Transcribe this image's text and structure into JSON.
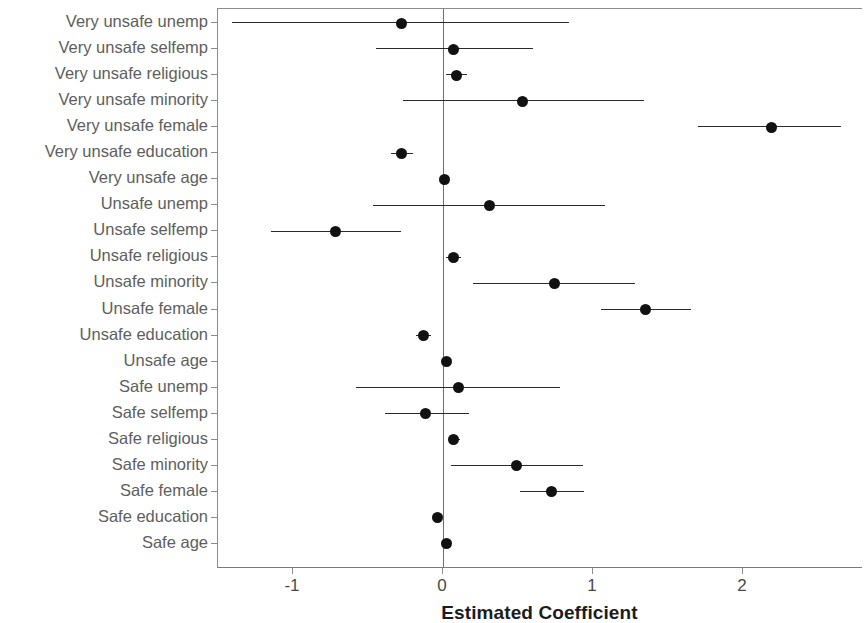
{
  "chart_data": {
    "type": "scatter",
    "subtype": "coefficient-plot-with-error-bars",
    "title": "",
    "xlabel": "Estimated Coefficient",
    "ylabel": "",
    "xlim": [
      -1.5,
      2.8
    ],
    "ylim": [
      0,
      22
    ],
    "grid": false,
    "legend": null,
    "xticks": [
      -1,
      0,
      1,
      2
    ],
    "xtick_labels": [
      "-1",
      "0",
      "1",
      "2"
    ],
    "zero_reference_line": 0,
    "marker": "filled-circle",
    "categories": [
      "Very unsafe unemp",
      "Very unsafe selfemp",
      "Very unsafe religious",
      "Very unsafe minority",
      "Very unsafe female",
      "Very unsafe education",
      "Very unsafe age",
      "Unsafe unemp",
      "Unsafe selfemp",
      "Unsafe religious",
      "Unsafe minority",
      "Unsafe female",
      "Unsafe education",
      "Unsafe age",
      "Safe unemp",
      "Safe selfemp",
      "Safe religious",
      "Safe minority",
      "Safe female",
      "Safe education",
      "Safe age"
    ],
    "points": [
      {
        "label": "Very unsafe unemp",
        "estimate": -0.28,
        "low": -1.41,
        "high": 0.84
      },
      {
        "label": "Very unsafe selfemp",
        "estimate": 0.07,
        "low": -0.45,
        "high": 0.6
      },
      {
        "label": "Very unsafe religious",
        "estimate": 0.09,
        "low": 0.02,
        "high": 0.16
      },
      {
        "label": "Very unsafe minority",
        "estimate": 0.53,
        "low": -0.27,
        "high": 1.34
      },
      {
        "label": "Very unsafe female",
        "estimate": 2.19,
        "low": 1.7,
        "high": 2.65
      },
      {
        "label": "Very unsafe education",
        "estimate": -0.28,
        "low": -0.35,
        "high": -0.2
      },
      {
        "label": "Very unsafe age",
        "estimate": 0.01,
        "low": -0.01,
        "high": 0.03
      },
      {
        "label": "Unsafe unemp",
        "estimate": 0.31,
        "low": -0.47,
        "high": 1.08
      },
      {
        "label": "Unsafe selfemp",
        "estimate": -0.72,
        "low": -1.15,
        "high": -0.28
      },
      {
        "label": "Unsafe religious",
        "estimate": 0.07,
        "low": 0.02,
        "high": 0.12
      },
      {
        "label": "Unsafe minority",
        "estimate": 0.74,
        "low": 0.2,
        "high": 1.28
      },
      {
        "label": "Unsafe female",
        "estimate": 1.35,
        "low": 1.05,
        "high": 1.65
      },
      {
        "label": "Unsafe education",
        "estimate": -0.13,
        "low": -0.18,
        "high": -0.08
      },
      {
        "label": "Unsafe age",
        "estimate": 0.02,
        "low": 0.0,
        "high": 0.03
      },
      {
        "label": "Safe unemp",
        "estimate": 0.1,
        "low": -0.58,
        "high": 0.78
      },
      {
        "label": "Safe selfemp",
        "estimate": -0.12,
        "low": -0.39,
        "high": 0.17
      },
      {
        "label": "Safe religious",
        "estimate": 0.07,
        "low": 0.03,
        "high": 0.11
      },
      {
        "label": "Safe minority",
        "estimate": 0.49,
        "low": 0.05,
        "high": 0.93
      },
      {
        "label": "Safe female",
        "estimate": 0.72,
        "low": 0.51,
        "high": 0.94
      },
      {
        "label": "Safe education",
        "estimate": -0.04,
        "low": -0.07,
        "high": -0.01
      },
      {
        "label": "Safe age",
        "estimate": 0.02,
        "low": 0.01,
        "high": 0.03
      }
    ]
  },
  "axis": {
    "x_title": "Estimated Coefficient",
    "x_tick_labels": [
      "-1",
      "0",
      "1",
      "2"
    ]
  },
  "colors": {
    "point": "#111111",
    "error_bar": "#2a2a2a",
    "axis_line": "#8d8d8d",
    "zero_line": "#6e6e6e",
    "label_text": "#5e5e5e",
    "tick_text": "#4a4a4a",
    "title_text": "#1c1c1c",
    "background": "#ffffff"
  }
}
